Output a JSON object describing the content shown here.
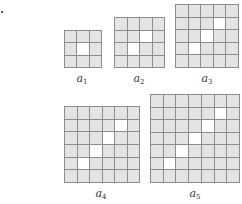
{
  "figure": {
    "panels": [
      {
        "id": "a1",
        "label": "a",
        "subscript": "1",
        "size": 3,
        "white_cells": [
          [
            1,
            1
          ]
        ],
        "box": {
          "x": 64,
          "y": 30,
          "w": 38,
          "h": 38
        },
        "label_pos": {
          "x": 82,
          "y": 72
        }
      },
      {
        "id": "a2",
        "label": "a",
        "subscript": "2",
        "size": 4,
        "white_cells": [
          [
            1,
            2
          ],
          [
            2,
            1
          ]
        ],
        "box": {
          "x": 114,
          "y": 17,
          "w": 51,
          "h": 51
        },
        "label_pos": {
          "x": 139,
          "y": 72
        }
      },
      {
        "id": "a3",
        "label": "a",
        "subscript": "3",
        "size": 5,
        "white_cells": [
          [
            1,
            3
          ],
          [
            2,
            2
          ],
          [
            3,
            1
          ]
        ],
        "box": {
          "x": 175,
          "y": 4,
          "w": 64,
          "h": 64
        },
        "label_pos": {
          "x": 207,
          "y": 72
        }
      },
      {
        "id": "a4",
        "label": "a",
        "subscript": "4",
        "size": 6,
        "white_cells": [
          [
            1,
            4
          ],
          [
            2,
            3
          ],
          [
            3,
            2
          ],
          [
            4,
            1
          ]
        ],
        "box": {
          "x": 64,
          "y": 106,
          "w": 76,
          "h": 77
        },
        "label_pos": {
          "x": 101,
          "y": 187
        }
      },
      {
        "id": "a5",
        "label": "a",
        "subscript": "5",
        "size": 7,
        "white_cells": [
          [
            1,
            5
          ],
          [
            2,
            4
          ],
          [
            3,
            3
          ],
          [
            4,
            2
          ],
          [
            5,
            1
          ]
        ],
        "box": {
          "x": 150,
          "y": 94,
          "w": 90,
          "h": 89
        },
        "label_pos": {
          "x": 195,
          "y": 187
        }
      }
    ],
    "colors": {
      "cell_fill": "#e4e4e4",
      "highlight_fill": "#ffffff",
      "grid_line": "#8c8c8c"
    }
  }
}
